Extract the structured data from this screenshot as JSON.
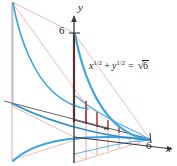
{
  "figure": {
    "name": "solid-of-revolution-cross-sections",
    "background_color": "#ffffff",
    "axes": {
      "y_label": "y",
      "x_label": "x",
      "z_label": "",
      "y_tick_label": "6",
      "x_tick_label": "6",
      "axis_color": "#3a3a3a"
    },
    "equation": {
      "lhs_base_1": "x",
      "lhs_exp_1": "1/2",
      "plus": "+",
      "lhs_base_2": "y",
      "lhs_exp_2": "1/2",
      "equals": "=",
      "radical_glyph": "√",
      "radical_body": "6",
      "full_text": "x^(1/2) + y^(1/2) = √6"
    },
    "colors": {
      "curve_blue": "#3aa5dc",
      "curve_blue_dark": "#2b8fc9",
      "cross_section_pink": "#f0b3ae",
      "cross_section_pink_light": "#f6cdc9",
      "axis_red": "#8e1b1b",
      "axis_dark": "#3a3a3a",
      "outline_pink": "#e8b6b2"
    },
    "geometry": {
      "origin_x": 74,
      "origin_y": 137,
      "x_axis_end_x": 165,
      "x_axis_end_y": 146,
      "y_axis_top_y": 14,
      "y_six_y": 33,
      "x_six_x": 150,
      "x_six_y": 139,
      "z_axis_end_x": 4,
      "z_axis_end_y": 101,
      "depth_dx": -62,
      "depth_dy": -31
    }
  }
}
